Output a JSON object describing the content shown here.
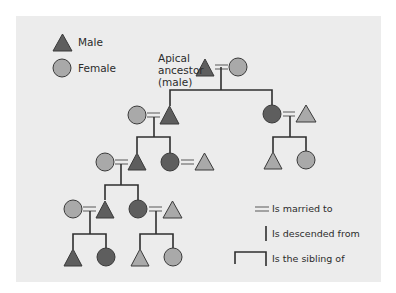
{
  "legend": {
    "male_label": "Male",
    "female_label": "Female"
  },
  "annotation": {
    "apical_line1": "Apical",
    "apical_line2": "ancestor",
    "apical_line3": "(male)"
  },
  "key": {
    "married": "Is married to",
    "descended": "Is descended from",
    "sibling": "Is the sibling of"
  },
  "colors": {
    "panel": "#ececec",
    "dark_fill": "#5e5e5e",
    "light_fill": "#a9a9a9",
    "stroke": "#3a3a3a",
    "line": "#2f2f2f"
  },
  "symbols": {
    "male": "triangle",
    "female": "circle",
    "marriage": "double-line (=)",
    "descent": "vertical line",
    "sibling": "bracket line"
  },
  "tree": {
    "apical": {
      "sex": "male",
      "tone": "dark",
      "spouse": {
        "sex": "female",
        "tone": "light"
      },
      "children": [
        {
          "sex": "male",
          "tone": "dark",
          "spouse": {
            "sex": "female",
            "tone": "light"
          },
          "children": [
            {
              "sex": "male",
              "tone": "dark",
              "spouse": {
                "sex": "female",
                "tone": "light"
              },
              "children": [
                {
                  "sex": "male",
                  "tone": "dark",
                  "spouse": {
                    "sex": "female",
                    "tone": "light"
                  },
                  "children": [
                    {
                      "sex": "male",
                      "tone": "dark"
                    },
                    {
                      "sex": "female",
                      "tone": "dark"
                    }
                  ]
                },
                {
                  "sex": "female",
                  "tone": "dark",
                  "spouse": {
                    "sex": "male",
                    "tone": "light"
                  },
                  "children": [
                    {
                      "sex": "male",
                      "tone": "light"
                    },
                    {
                      "sex": "female",
                      "tone": "light"
                    }
                  ]
                }
              ]
            },
            {
              "sex": "female",
              "tone": "dark",
              "spouse": {
                "sex": "male",
                "tone": "light"
              }
            }
          ]
        },
        {
          "sex": "female",
          "tone": "dark",
          "spouse": {
            "sex": "male",
            "tone": "light"
          },
          "children": [
            {
              "sex": "male",
              "tone": "light"
            },
            {
              "sex": "female",
              "tone": "light"
            }
          ]
        }
      ]
    }
  }
}
